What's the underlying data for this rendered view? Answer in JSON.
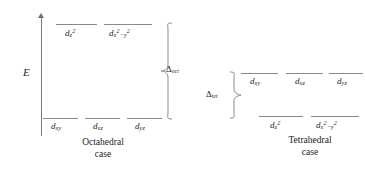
{
  "figure": {
    "axis": {
      "label": "E",
      "name": "energy-axis"
    },
    "octahedral": {
      "caption_line1": "Octahedral",
      "caption_line2": "case",
      "splitting": {
        "symbol": "Δ",
        "subscript": "oct"
      },
      "upper_levels": [
        {
          "d": "d",
          "sub": "z",
          "sup": "2",
          "tail": ""
        },
        {
          "d": "d",
          "sub": "x",
          "sup": "2",
          "tail": "−y",
          "tail_sup": "2"
        }
      ],
      "lower_levels": [
        {
          "d": "d",
          "sub": "xy"
        },
        {
          "d": "d",
          "sub": "xz"
        },
        {
          "d": "d",
          "sub": "yz"
        }
      ]
    },
    "tetrahedral": {
      "caption_line1": "Tetrahedral",
      "caption_line2": "case",
      "splitting": {
        "symbol": "Δ",
        "subscript": "tet"
      },
      "upper_levels": [
        {
          "d": "d",
          "sub": "xy"
        },
        {
          "d": "d",
          "sub": "xz"
        },
        {
          "d": "d",
          "sub": "yz"
        }
      ],
      "lower_levels": [
        {
          "d": "d",
          "sub": "z",
          "sup": "2",
          "tail": ""
        },
        {
          "d": "d",
          "sub": "x",
          "sup": "2",
          "tail": "−y",
          "tail_sup": "2"
        }
      ]
    }
  }
}
